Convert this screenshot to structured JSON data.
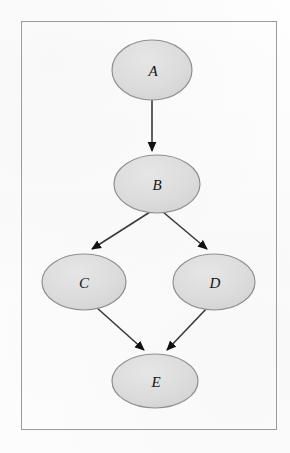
{
  "diagram": {
    "frame": {
      "border_color": "#9b9b9b",
      "background": "#fdfdfd"
    },
    "node_style": {
      "shape": "ellipse",
      "fill_color": "#dcdcdc",
      "stroke_color": "#8f8f8f",
      "label_color": "#151515",
      "label_style": "italic-serif"
    },
    "edge_style": {
      "line_color": "#3a3a3a",
      "arrowhead": "solid-triangle",
      "arrowhead_color": "#111111"
    },
    "nodes": [
      {
        "id": "A",
        "label": "A",
        "cx": 152,
        "cy": 70,
        "rx": 40,
        "ry": 30
      },
      {
        "id": "B",
        "label": "B",
        "cx": 157,
        "cy": 184,
        "rx": 43,
        "ry": 29
      },
      {
        "id": "C",
        "label": "C",
        "cx": 84,
        "cy": 282,
        "rx": 42,
        "ry": 28
      },
      {
        "id": "D",
        "label": "D",
        "cx": 214,
        "cy": 282,
        "rx": 41,
        "ry": 28
      },
      {
        "id": "E",
        "label": "E",
        "cx": 155,
        "cy": 381,
        "rx": 43,
        "ry": 27
      }
    ],
    "edges": [
      {
        "from": "A",
        "to": "B",
        "label": ""
      },
      {
        "from": "B",
        "to": "C",
        "label": ""
      },
      {
        "from": "B",
        "to": "D",
        "label": ""
      },
      {
        "from": "C",
        "to": "E",
        "label": ""
      },
      {
        "from": "D",
        "to": "E",
        "label": ""
      }
    ]
  }
}
